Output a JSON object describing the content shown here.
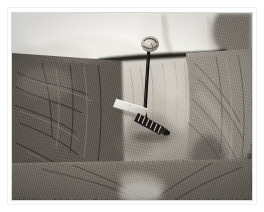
{
  "image": {
    "type": "photograph",
    "medium": "black-and-white film photograph",
    "subject": "veterinary-procedure",
    "caption": "Grayscale close-up photograph of an animal's shaved and furred neck region. A gloved hand presses the skin from above while a dark catheter tube, anchored by a suture knot at the skin-entry point, runs downward and is secured with a pale adhesive tape wing and a dark ribbed connector hub.",
    "orientation": "landscape",
    "border_color": "#ffffff",
    "frame_line_color": "#f0f0f0"
  },
  "frame": {
    "left": 12,
    "top": 13,
    "width": 240,
    "height": 187
  },
  "palette": {
    "paper_white": "#ffffff",
    "highlight": "#f3f1ec",
    "skin_light": "#cfcac2",
    "mid_gray": "#9a948c",
    "fur_gray": "#7d776f",
    "fur_dark": "#4a453f",
    "shadow": "#2b2824",
    "tube_black": "#141210",
    "tape_white": "#ece9e1"
  },
  "regions": [
    {
      "name": "hand-top",
      "label": "Hand / fingers pressing skin",
      "note": "Bright, smooth, out-of-focus forms occupying the upper band of the frame",
      "tone": "highlight"
    },
    {
      "name": "fur-left",
      "label": "Dark matted fur, left flank",
      "note": "Coarse dark striated fur filling the left third",
      "tone": "fur_dark"
    },
    {
      "name": "skin-center",
      "label": "Shaved central skin panel",
      "note": "Lighter vertical band down the middle where hair has been clipped",
      "tone": "skin_light"
    },
    {
      "name": "fur-right",
      "label": "Lighter fur, right flank",
      "note": "Mid-gray fur with diagonal hair direction",
      "tone": "mid_gray"
    },
    {
      "name": "fur-bottom",
      "label": "Lower fur and shadow",
      "note": "Darker converging fur toward bottom of frame",
      "tone": "fur_gray"
    }
  ],
  "objects": [
    {
      "name": "suture-knot",
      "label": "Suture knot at skin entry",
      "x": 148,
      "y": 45,
      "description": "Small pale knotted tissue/suture cluster where the tube enters the skin"
    },
    {
      "name": "catheter-tube",
      "label": "Dark catheter tubing",
      "from_x": 148,
      "from_y": 48,
      "to_x": 146,
      "to_y": 116,
      "description": "Near-black thin tube running vertically downward"
    },
    {
      "name": "tape-wing",
      "label": "Adhesive tape wing",
      "x": 128,
      "y": 101,
      "description": "Pale angled rectangular strip of tape securing the line"
    },
    {
      "name": "connector-hub",
      "label": "Ribbed connector hub",
      "x": 150,
      "y": 116,
      "description": "Dark segmented/ribbed fitting at the lower end of the tubing"
    },
    {
      "name": "skin-fold",
      "label": "Skin fold / incision line",
      "x": 120,
      "y": 60,
      "description": "Dark horizontal crease beneath the hand"
    }
  ]
}
